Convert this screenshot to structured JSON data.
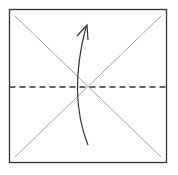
{
  "diagram": {
    "type": "origami-fold-step",
    "colors": {
      "border": "#333333",
      "crease": "#9a9a9a",
      "fold_line": "#333333",
      "arrow": "#333333",
      "paper": "#ffffff"
    },
    "elements": {
      "paper": "square sheet",
      "creases": [
        "diagonal top-left to bottom-right",
        "diagonal top-right to bottom-left"
      ],
      "fold_line": "horizontal valley fold (dashed) through center",
      "arrow": "curved arrow from bottom to top indicating fold bottom edge up"
    }
  }
}
